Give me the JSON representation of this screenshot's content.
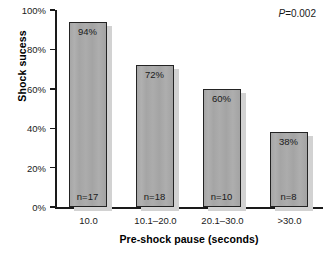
{
  "chart_data": {
    "type": "bar",
    "title": "",
    "subtitle": "",
    "xlabel": "Pre-shock pause (seconds)",
    "ylabel": "Shock sucess",
    "categories": [
      "10.0",
      "10.1–20.0",
      "20.1–30.0",
      ">30.0"
    ],
    "values": [
      94,
      72,
      60,
      38
    ],
    "value_labels": [
      "94%",
      "72%",
      "60%",
      "38%"
    ],
    "counts": [
      17,
      18,
      10,
      8
    ],
    "count_labels": [
      "n=17",
      "n=18",
      "n=10",
      "n=8"
    ],
    "ylim": [
      0,
      100
    ],
    "ytick_values": [
      0,
      20,
      40,
      60,
      80,
      100
    ],
    "ytick_labels": [
      "0%",
      "20%",
      "40%",
      "60%",
      "80%",
      "100%"
    ],
    "grid": false,
    "legend": null,
    "annotations": [
      {
        "name": "p-value",
        "prefix": "P",
        "text": "=0.002",
        "full_text": "P=0.002",
        "position": "top-right"
      }
    ],
    "colors": {
      "bar_fill": "#a9a9a9",
      "bar_border": "#232323",
      "bar_shadow": "#d2d2d2",
      "axis": "#1a1a1a",
      "background": "#ffffff",
      "text": "#1a1a1a"
    }
  }
}
